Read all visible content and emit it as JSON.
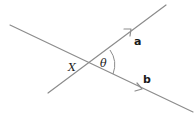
{
  "diagram": {
    "type": "vector-angle",
    "vectors": [
      {
        "name": "a",
        "label": "a"
      },
      {
        "name": "b",
        "label": "b"
      }
    ],
    "intersection_label": "X",
    "angle_label": "θ",
    "colors": {
      "line": "#8c8c8c",
      "text": "#1a1a1a",
      "background": "#ffffff"
    }
  }
}
